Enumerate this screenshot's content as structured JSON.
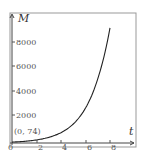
{
  "chart_data": {
    "type": "line",
    "title": "",
    "xlabel": "t",
    "ylabel": "M",
    "xlim": [
      0,
      9.5
    ],
    "ylim": [
      0,
      10000
    ],
    "x_ticks": [
      "2",
      "4",
      "6",
      "8"
    ],
    "y_ticks": [
      "2000",
      "4000",
      "6000",
      "8000"
    ],
    "origin_label": "0",
    "grid": false,
    "legend": null,
    "annotations": [
      {
        "text": "(0, 74)",
        "x": 0,
        "y": 74
      }
    ],
    "series": [
      {
        "name": "M(t)",
        "x": [
          0,
          1,
          2,
          3,
          4,
          5,
          6,
          7,
          8
        ],
        "values": [
          74,
          136,
          250,
          460,
          845,
          1550,
          2850,
          5240,
          9400
        ]
      }
    ]
  }
}
